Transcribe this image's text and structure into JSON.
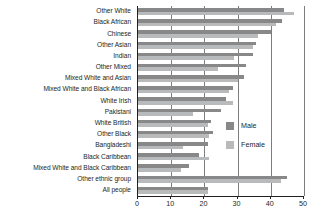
{
  "chart_data": {
    "type": "bar",
    "orientation": "horizontal",
    "title": "",
    "xlabel": "",
    "ylabel": "",
    "xlim": [
      0,
      50
    ],
    "xticks": [
      0,
      10,
      20,
      30,
      40,
      50
    ],
    "xtick_labels": [
      "0",
      "10",
      "20",
      "30",
      "40",
      "50"
    ],
    "grid": true,
    "grid_axis": "x",
    "legend_position": "right",
    "categories": [
      "Other White",
      "Black African",
      "Chinese",
      "Other Asian",
      "Indian",
      "Other Mixed",
      "Mixed White and Asian",
      "Mixed White and Black African",
      "White Irish",
      "Pakistani",
      "White British",
      "Other Black",
      "Bangladeshi",
      "Black Caribbean",
      "Mixed White and Black Caribbean",
      "Other ethnic group",
      "All people"
    ],
    "series": [
      {
        "name": "Male",
        "color": "#888889",
        "values": [
          44.0,
          43.5,
          40.0,
          35.5,
          34.5,
          32.5,
          32.0,
          28.5,
          26.5,
          25.0,
          22.0,
          22.5,
          21.0,
          18.5,
          15.5,
          45.0,
          21.0
        ]
      },
      {
        "name": "Female",
        "color": "#b9babb",
        "values": [
          47.0,
          41.5,
          36.0,
          34.5,
          29.0,
          24.0,
          30.0,
          27.5,
          28.5,
          16.5,
          21.0,
          21.5,
          13.5,
          21.5,
          13.0,
          43.0,
          21.0
        ]
      }
    ]
  },
  "legend": {
    "items": [
      {
        "label": "Male",
        "color": "#888889"
      },
      {
        "label": "Female",
        "color": "#b9babb"
      }
    ]
  },
  "colors": {
    "male": "#888889",
    "female": "#b9babb",
    "axis": "#231f20",
    "grid": "#7d7d7d",
    "background": "#ffffff"
  }
}
